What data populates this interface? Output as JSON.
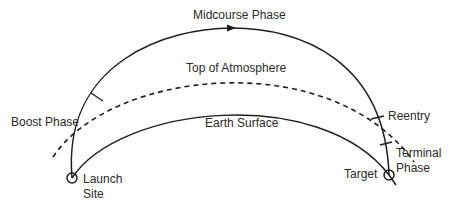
{
  "diagram": {
    "type": "ballistic-missile-trajectory",
    "colors": {
      "line": "#1f1f1f",
      "text": "#2b2b2b",
      "background": "#ffffff"
    },
    "labels": {
      "midcourse": "Midcourse Phase",
      "atmosphere": "Top of Atmosphere",
      "boost": "Boost Phase",
      "earth": "Earth Surface",
      "reentry": "Reentry",
      "terminal_line1": "Terminal",
      "terminal_line2": "Phase",
      "target": "Target",
      "launch_line1": "Launch",
      "launch_line2": "Site"
    }
  }
}
